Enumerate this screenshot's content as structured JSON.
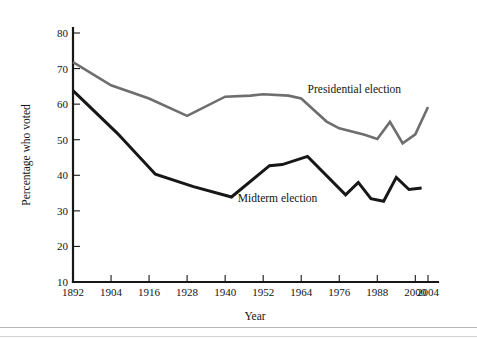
{
  "chart_data": {
    "type": "line",
    "title": "",
    "xlabel": "Year",
    "ylabel": "Percentage who voted",
    "xlim": [
      1892,
      2004
    ],
    "ylim": [
      10,
      80
    ],
    "grid": false,
    "legend": "inline-annotations",
    "x_ticks": [
      "1892",
      "1904",
      "1916",
      "1928",
      "1940",
      "1952",
      "1964",
      "1976",
      "1988",
      "2000",
      "2004"
    ],
    "y_ticks": [
      "10",
      "20",
      "30",
      "40",
      "50",
      "60",
      "70",
      "80"
    ],
    "series": [
      {
        "name": "Presidential election",
        "color": "#6e6e6e",
        "label_x": 1966,
        "label_y": 63,
        "x": [
          1892,
          1904,
          1916,
          1928,
          1940,
          1948,
          1952,
          1960,
          1964,
          1972,
          1976,
          1984,
          1988,
          1992,
          1996,
          2000,
          2004
        ],
        "values": [
          71.8,
          65.3,
          61.6,
          56.7,
          62.1,
          62.4,
          62.8,
          62.4,
          61.6,
          55.1,
          53.2,
          51.4,
          50.2,
          55.0,
          49.0,
          51.5,
          59.2
        ]
      },
      {
        "name": "Midterm election",
        "color": "#171717",
        "label_x": 1944,
        "label_y": 32.5,
        "x": [
          1892,
          1906,
          1918,
          1930,
          1942,
          1954,
          1958,
          1966,
          1978,
          1982,
          1986,
          1990,
          1994,
          1998,
          2002
        ],
        "values": [
          63.8,
          51.8,
          40.3,
          36.8,
          33.9,
          42.7,
          43.0,
          45.3,
          34.5,
          38.0,
          33.4,
          32.7,
          39.4,
          36.0,
          36.4
        ]
      }
    ]
  },
  "annotations": {
    "presidential_label": "Presidential election",
    "midterm_label": "Midterm election"
  },
  "axes": {
    "x_title": "Year",
    "y_title": "Percentage who voted"
  }
}
